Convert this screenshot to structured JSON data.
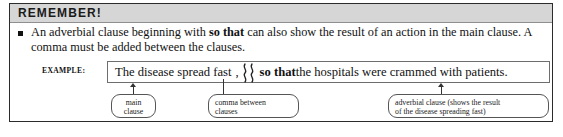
{
  "box": {
    "header_title": "REMEMBER!"
  },
  "rule": {
    "bullet_icon": "square-bullet-icon",
    "text_part1": "An adverbial clause beginning with ",
    "text_emphasis": "so that",
    "text_part2": " can also show the result of an action in the main clause. A comma must be added between the clauses."
  },
  "example": {
    "label": "EXAMPLE:",
    "sentence": {
      "main_clause": "The disease spread fast",
      "comma": ",",
      "separator_icon": "double-squiggle-icon",
      "subordinator": "so that",
      "adverbial_clause": " the hospitals were crammed with patients."
    }
  },
  "callouts": [
    {
      "name": "main-clause",
      "lines": [
        "main",
        "clause"
      ],
      "align": "center"
    },
    {
      "name": "comma-between-clauses",
      "lines": [
        "comma between",
        "clauses"
      ],
      "align": "left"
    },
    {
      "name": "adverbial-clause",
      "lines": [
        "adverbial clause (shows the result",
        "of the disease spreading fast)"
      ],
      "align": "left"
    }
  ],
  "colors": {
    "header_band": "#d6d6d6",
    "border": "#2b2b2b",
    "text": "#111111",
    "connector": "#333333"
  }
}
